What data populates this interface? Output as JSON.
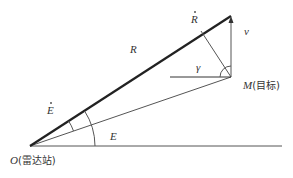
{
  "diagram": {
    "title": "",
    "labels": {
      "R_dot": "R",
      "v": "v",
      "R": "R",
      "gamma": "γ",
      "M_symbol": "M",
      "M_name": "(目标)",
      "E_dot": "E",
      "E": "E",
      "O_symbol": "O",
      "O_name": "(雷达站)"
    },
    "nodes": [
      {
        "id": "O",
        "label": "O(雷达站)",
        "meaning": "radar station"
      },
      {
        "id": "M",
        "label": "M(目标)",
        "meaning": "target"
      }
    ],
    "edges": [
      {
        "from": "O",
        "to": "tip",
        "label": "R",
        "style": "thick"
      },
      {
        "from": "O",
        "to": "M",
        "style": "thin"
      },
      {
        "from": "O",
        "to": "horizon",
        "style": "thin"
      },
      {
        "from": "M",
        "to": "tip",
        "label": "v",
        "style": "arrow"
      }
    ],
    "angles": [
      "E (elevation)",
      "Ė (elevation rate)",
      "γ"
    ],
    "colors": {
      "line": "#333333",
      "thin_line": "#555555",
      "background": "#ffffff"
    }
  }
}
